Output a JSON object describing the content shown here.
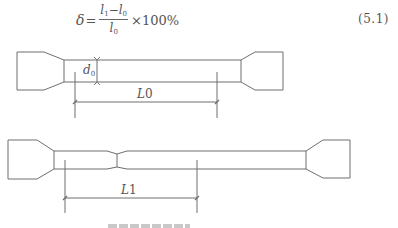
{
  "formula": {
    "lhs": "δ",
    "equals": "=",
    "numerator": {
      "a": "l",
      "a_sub": "1",
      "minus": "−",
      "b": "l",
      "b_sub": "0"
    },
    "denominator": {
      "v": "l",
      "v_sub": "0"
    },
    "multiplier": "×100%",
    "number": "(5.1)"
  },
  "figure": {
    "specimen_before": {
      "diameter_label": "d",
      "diameter_sub": "0",
      "gauge_label": "L",
      "gauge_sub": "0"
    },
    "specimen_after": {
      "gauge_label": "L",
      "gauge_sub": "1"
    },
    "line_color": "#6e6e6e"
  }
}
